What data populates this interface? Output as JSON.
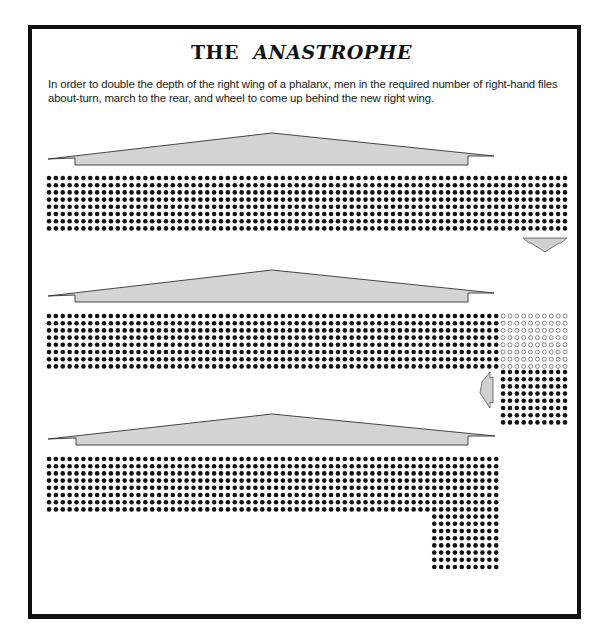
{
  "title": {
    "prefix": "THE",
    "emphasis": "ANASTROPHE"
  },
  "caption": "In order to double the depth of the right wing of a phalanx, men in the required number of right-hand files about-turn, march to the rear, and wheel to come up behind the new right wing.",
  "colors": {
    "frame": "#111111",
    "dot": "#111111",
    "banner_fill": "#d4d4d4",
    "banner_stroke": "#333333",
    "arrow_fill": "#d0d0d0"
  },
  "grid": {
    "x0": 49,
    "dx": 6.88,
    "dy": 7.2,
    "dot_r": 2.3
  },
  "stages": [
    {
      "name": "stage-1-original-phalanx",
      "banner": {
        "left": 48,
        "notch_l": 75,
        "apex_x": 272,
        "apex_y": 133,
        "notch_r": 468,
        "right": 494,
        "tip_y": 157,
        "bottom": 165
      },
      "blocks": [
        {
          "type": "solid",
          "col_start": 0,
          "cols": 76,
          "y0": 178,
          "rows": 8
        }
      ],
      "arrow": {
        "dir": "down",
        "x": 523,
        "y": 238,
        "w": 44,
        "h": 14
      }
    },
    {
      "name": "stage-2-files-about-turn",
      "banner": {
        "left": 48,
        "notch_l": 75,
        "apex_x": 272,
        "apex_y": 270,
        "notch_r": 468,
        "right": 494,
        "tip_y": 294,
        "bottom": 302
      },
      "blocks": [
        {
          "type": "solid",
          "col_start": 0,
          "cols": 66,
          "y0": 316,
          "rows": 8
        },
        {
          "type": "open",
          "col_start": 66,
          "cols": 10,
          "y0": 316,
          "rows": 8
        },
        {
          "type": "solid",
          "col_start": 66,
          "cols": 10,
          "y0": 372,
          "rows": 8
        }
      ],
      "arrow": {
        "dir": "left",
        "x": 480,
        "y": 372,
        "w": 13,
        "h": 36
      }
    },
    {
      "name": "stage-3-doubled-right-wing",
      "banner": {
        "left": 48,
        "notch_l": 76,
        "apex_x": 272,
        "apex_y": 414,
        "notch_r": 468,
        "right": 495,
        "tip_y": 437,
        "bottom": 445
      },
      "blocks": [
        {
          "type": "solid",
          "col_start": 0,
          "cols": 66,
          "y0": 459,
          "rows": 8
        },
        {
          "type": "solid",
          "col_start": 56,
          "cols": 10,
          "y0": 516.6,
          "rows": 8
        }
      ],
      "arrow": null
    }
  ]
}
